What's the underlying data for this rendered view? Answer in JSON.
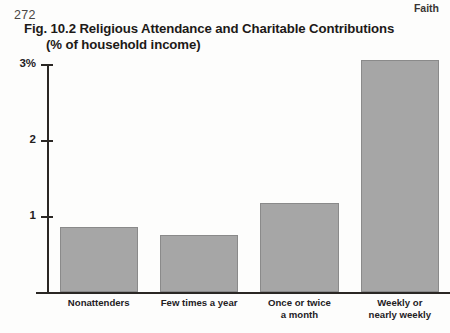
{
  "page": {
    "folio": "272",
    "running_head": "Faith"
  },
  "figure": {
    "title_line1": "Fig. 10.2 Religious Attendance and Charitable Contributions",
    "title_line2": "(% of household income)"
  },
  "chart_data": {
    "type": "bar",
    "title": "Fig. 10.2 Religious Attendance and Charitable Contributions (% of household income)",
    "categories": [
      "Nonattenders",
      "Few times a year",
      "Once or twice\na month",
      "Weekly or\nnearly weekly"
    ],
    "category_lines": [
      [
        "Nonattenders"
      ],
      [
        "Few times a year"
      ],
      [
        "Once or twice",
        "a month"
      ],
      [
        "Weekly or",
        "nearly weekly"
      ]
    ],
    "values": [
      0.85,
      0.75,
      1.17,
      3.05
    ],
    "xlabel": "",
    "ylabel": "",
    "ylim": [
      0,
      3.0
    ],
    "yticks": [
      1,
      2,
      3
    ],
    "ytick_labels": [
      "1",
      "2",
      "3%"
    ],
    "grid": false,
    "legend": "none",
    "bar_color": "#a6a6a6",
    "axis_color": "#2a2724"
  }
}
